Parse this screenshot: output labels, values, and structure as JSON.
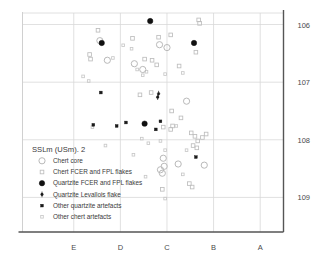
{
  "chart_data": {
    "type": "scatter",
    "title": "SSLm (USm). 2",
    "xlabel": "",
    "ylabel": "",
    "grid": true,
    "legend_position": "lower-left-inside",
    "x_categories": [
      "E",
      "D",
      "C",
      "B",
      "A"
    ],
    "x_tick_labels": [
      "E",
      "D",
      "C",
      "B",
      "A"
    ],
    "y_tick_labels": [
      "106",
      "107",
      "108",
      "109"
    ],
    "y_tick_values": [
      106,
      107,
      108,
      109
    ],
    "ylim": [
      105.8,
      109.6
    ],
    "y_inverted": true,
    "xlim": [
      0.0,
      5.6
    ],
    "x_tick_values": [
      1.1,
      2.1,
      3.1,
      4.1,
      5.1
    ],
    "series": [
      {
        "name": "Chert core",
        "marker": "circle-open-large",
        "color": "#b9b9b9",
        "size": 6.2,
        "points": [
          {
            "x": 1.66,
            "y": 106.28
          },
          {
            "x": 1.82,
            "y": 106.62
          },
          {
            "x": 2.4,
            "y": 106.68
          },
          {
            "x": 2.94,
            "y": 106.35
          },
          {
            "x": 3.1,
            "y": 106.4
          },
          {
            "x": 3.52,
            "y": 107.33
          },
          {
            "x": 3.02,
            "y": 108.32
          },
          {
            "x": 2.96,
            "y": 108.52
          },
          {
            "x": 3.0,
            "y": 108.58
          },
          {
            "x": 3.04,
            "y": 108.46
          },
          {
            "x": 3.34,
            "y": 108.42
          },
          {
            "x": 3.9,
            "y": 108.44
          },
          {
            "x": 2.58,
            "y": 106.78
          }
        ]
      },
      {
        "name": "Chert FCER and FPL flakes",
        "marker": "square-open",
        "color": "#bdbdbd",
        "size": 3.6,
        "points": [
          {
            "x": 1.62,
            "y": 106.1
          },
          {
            "x": 1.44,
            "y": 106.52
          },
          {
            "x": 1.46,
            "y": 106.6
          },
          {
            "x": 2.36,
            "y": 106.24
          },
          {
            "x": 2.92,
            "y": 106.22
          },
          {
            "x": 3.18,
            "y": 106.18
          },
          {
            "x": 3.78,
            "y": 105.92
          },
          {
            "x": 3.8,
            "y": 105.98
          },
          {
            "x": 3.72,
            "y": 106.48
          },
          {
            "x": 2.62,
            "y": 106.6
          },
          {
            "x": 2.78,
            "y": 106.62
          },
          {
            "x": 2.88,
            "y": 106.7
          },
          {
            "x": 3.36,
            "y": 106.72
          },
          {
            "x": 2.52,
            "y": 107.22
          },
          {
            "x": 2.76,
            "y": 107.18
          },
          {
            "x": 3.2,
            "y": 107.5
          },
          {
            "x": 3.4,
            "y": 107.62
          },
          {
            "x": 3.02,
            "y": 107.78
          },
          {
            "x": 3.18,
            "y": 107.82
          },
          {
            "x": 3.22,
            "y": 107.76
          },
          {
            "x": 3.62,
            "y": 107.88
          },
          {
            "x": 3.7,
            "y": 107.94
          },
          {
            "x": 3.76,
            "y": 108.02
          },
          {
            "x": 3.86,
            "y": 107.96
          },
          {
            "x": 3.94,
            "y": 107.9
          },
          {
            "x": 3.66,
            "y": 108.1
          },
          {
            "x": 3.74,
            "y": 108.14
          },
          {
            "x": 3.0,
            "y": 108.86
          },
          {
            "x": 3.58,
            "y": 108.76
          },
          {
            "x": 3.64,
            "y": 108.82
          }
        ]
      },
      {
        "name": "Quartzite FCER and FPL flakes",
        "marker": "circle-filled-large",
        "color": "#111111",
        "size": 5.4,
        "points": [
          {
            "x": 1.7,
            "y": 106.32
          },
          {
            "x": 2.74,
            "y": 105.94
          },
          {
            "x": 2.62,
            "y": 107.72
          },
          {
            "x": 3.68,
            "y": 106.32
          }
        ]
      },
      {
        "name": "Quartzite Levallois flake",
        "marker": "circle-filled-small-pin",
        "color": "#1a1a1a",
        "size": 2.6,
        "points": [
          {
            "x": 2.92,
            "y": 107.2
          },
          {
            "x": 2.9,
            "y": 107.26
          }
        ]
      },
      {
        "name": "Other quartzite artefacts",
        "marker": "square-filled-small",
        "color": "#1a1a1a",
        "size": 2.8,
        "points": [
          {
            "x": 1.68,
            "y": 107.18
          },
          {
            "x": 2.02,
            "y": 107.76
          },
          {
            "x": 2.22,
            "y": 107.7
          },
          {
            "x": 2.96,
            "y": 107.68
          },
          {
            "x": 2.86,
            "y": 107.82
          },
          {
            "x": 3.72,
            "y": 108.3
          },
          {
            "x": 1.52,
            "y": 107.74
          }
        ]
      },
      {
        "name": "Other chert artefacts",
        "marker": "square-open-tiny",
        "color": "#c8c8c8",
        "size": 2.6,
        "points": [
          {
            "x": 1.3,
            "y": 106.9
          },
          {
            "x": 1.42,
            "y": 106.98
          },
          {
            "x": 1.5,
            "y": 107.78
          },
          {
            "x": 2.46,
            "y": 106.78
          },
          {
            "x": 2.58,
            "y": 106.88
          },
          {
            "x": 2.66,
            "y": 106.82
          },
          {
            "x": 3.06,
            "y": 106.86
          },
          {
            "x": 3.44,
            "y": 106.84
          },
          {
            "x": 2.34,
            "y": 106.42
          },
          {
            "x": 2.16,
            "y": 106.36
          },
          {
            "x": 1.94,
            "y": 106.58
          },
          {
            "x": 3.3,
            "y": 107.76
          },
          {
            "x": 2.7,
            "y": 108.06
          },
          {
            "x": 2.96,
            "y": 108.02
          },
          {
            "x": 2.64,
            "y": 108.64
          },
          {
            "x": 3.06,
            "y": 108.18
          },
          {
            "x": 3.44,
            "y": 108.6
          },
          {
            "x": 1.78,
            "y": 108.1
          },
          {
            "x": 2.38,
            "y": 108.26
          },
          {
            "x": 3.52,
            "y": 108.18
          },
          {
            "x": 3.06,
            "y": 109.02
          },
          {
            "x": 2.56,
            "y": 107.98
          }
        ]
      }
    ],
    "legend_entries": [
      {
        "label": "Chert core",
        "marker": "circle-open-large"
      },
      {
        "label": "Chert FCER and FPL flakes",
        "marker": "square-open"
      },
      {
        "label": "Quartzite FCER and FPL flakes",
        "marker": "circle-filled-large"
      },
      {
        "label": "Quartzite Levallois flake",
        "marker": "circle-filled-small-pin"
      },
      {
        "label": "Other quartzite artefacts",
        "marker": "square-filled-small"
      },
      {
        "label": "Other chert artefacts",
        "marker": "square-open-tiny"
      }
    ],
    "colors": {
      "axis": "#555555",
      "grid": "#d8d8d8",
      "text": "#3a3a3a",
      "light_marker": "#bdbdbd",
      "dark_marker": "#111111",
      "background": "#ffffff"
    }
  }
}
